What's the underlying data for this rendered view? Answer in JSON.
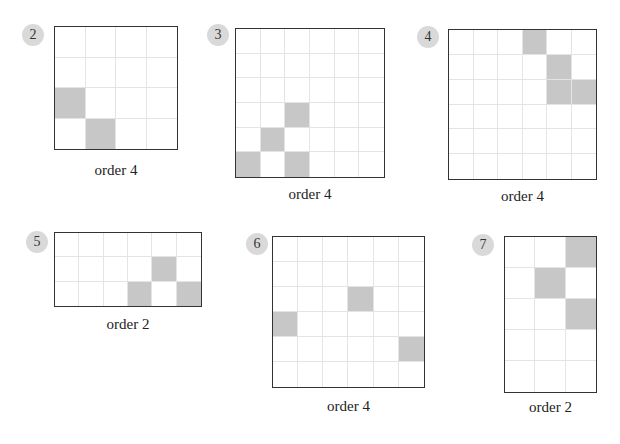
{
  "problems": [
    {
      "number": "2",
      "label": "order 4",
      "rows": 4,
      "cols": 4,
      "box": {
        "left": 54,
        "top": 26,
        "width": 124,
        "height": 124
      },
      "badge": {
        "left": 22,
        "top": 24
      },
      "label_pos": {
        "left": 54,
        "top": 162,
        "width": 124
      },
      "filled": [
        [
          2,
          0
        ],
        [
          3,
          1
        ]
      ]
    },
    {
      "number": "3",
      "label": "order 4",
      "rows": 6,
      "cols": 6,
      "box": {
        "left": 235,
        "top": 28,
        "width": 150,
        "height": 150
      },
      "badge": {
        "left": 207,
        "top": 24
      },
      "label_pos": {
        "left": 235,
        "top": 186,
        "width": 150
      },
      "filled": [
        [
          3,
          2
        ],
        [
          4,
          1
        ],
        [
          5,
          0
        ],
        [
          5,
          2
        ]
      ]
    },
    {
      "number": "4",
      "label": "order 4",
      "rows": 6,
      "cols": 6,
      "box": {
        "left": 448,
        "top": 29,
        "width": 149,
        "height": 151
      },
      "badge": {
        "left": 417,
        "top": 26
      },
      "label_pos": {
        "left": 448,
        "top": 188,
        "width": 149
      },
      "filled": [
        [
          0,
          3
        ],
        [
          1,
          4
        ],
        [
          2,
          4
        ],
        [
          2,
          5
        ]
      ]
    },
    {
      "number": "5",
      "label": "order 2",
      "rows": 3,
      "cols": 6,
      "box": {
        "left": 54,
        "top": 232,
        "width": 148,
        "height": 75
      },
      "badge": {
        "left": 26,
        "top": 231
      },
      "label_pos": {
        "left": 54,
        "top": 316,
        "width": 148
      },
      "filled": [
        [
          1,
          4
        ],
        [
          2,
          3
        ],
        [
          2,
          5
        ]
      ]
    },
    {
      "number": "6",
      "label": "order 4",
      "rows": 6,
      "cols": 6,
      "box": {
        "left": 272,
        "top": 236,
        "width": 153,
        "height": 152
      },
      "badge": {
        "left": 246,
        "top": 233
      },
      "label_pos": {
        "left": 272,
        "top": 398,
        "width": 153
      },
      "filled": [
        [
          2,
          3
        ],
        [
          3,
          0
        ],
        [
          4,
          5
        ]
      ]
    },
    {
      "number": "7",
      "label": "order 2",
      "rows": 5,
      "cols": 3,
      "box": {
        "left": 504,
        "top": 236,
        "width": 93,
        "height": 157
      },
      "badge": {
        "left": 472,
        "top": 234
      },
      "label_pos": {
        "left": 504,
        "top": 399,
        "width": 93
      },
      "filled": [
        [
          0,
          2
        ],
        [
          1,
          1
        ],
        [
          2,
          2
        ]
      ]
    }
  ],
  "colors": {
    "filled": "#c7c7c7",
    "border": "#333333",
    "gridline": "#e4e4e4",
    "badge": "#d9d9d9"
  }
}
